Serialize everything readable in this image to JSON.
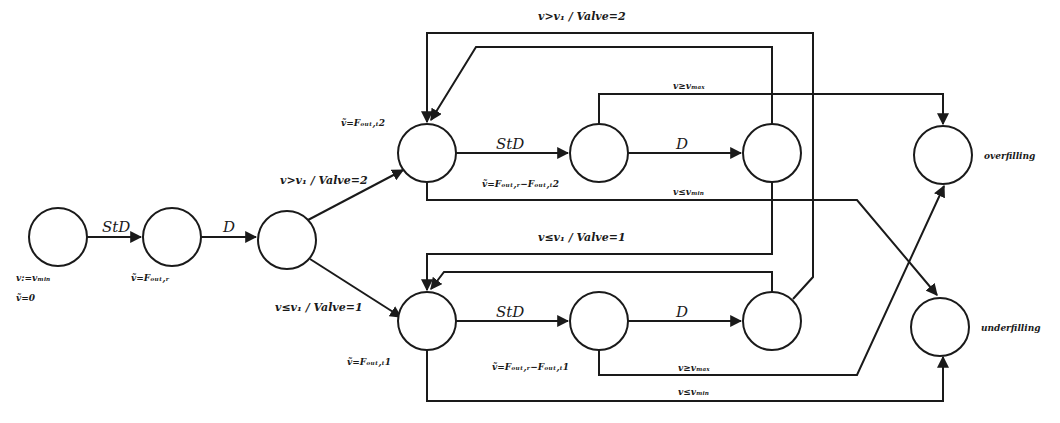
{
  "diagram": {
    "type": "state-machine",
    "states": {
      "init": {
        "label1": "v:=vₘᵢₙ",
        "label2": "ṽ=0"
      },
      "fill_r": {
        "label": "ṽ=Fₒᵤₜ,ᵣ"
      },
      "split": {
        "label": ""
      },
      "t2_a": {
        "label": "ṽ=Fₒᵤₜ,ₜ2"
      },
      "t2_b": {
        "label": "ṽ=Fₒᵤₜ,ᵣ−Fₒᵤₜ,ₜ2"
      },
      "t2_c": {
        "label": ""
      },
      "t1_a": {
        "label": "ṽ=Fₒᵤₜ,ₜ1"
      },
      "t1_b": {
        "label": "ṽ=Fₒᵤₜ,ᵣ−Fₒᵤₜ,ₜ1"
      },
      "t1_c": {
        "label": ""
      },
      "overfilling": {
        "label": "overfilling"
      },
      "underfilling": {
        "label": "underfilling"
      }
    },
    "transitions": {
      "init_to_r": "StD",
      "r_to_split": "D",
      "split_to_t2": "v>v₁ / Valve=2",
      "split_to_t1": "v≤v₁ / Valve=1",
      "t2_std": "StD",
      "t2_d": "D",
      "t1_std": "StD",
      "t1_d": "D",
      "loop_to_t2": "v>v₁ / Valve=2",
      "loop_to_t1": "v≤v₁ / Valve=1",
      "t2_vmax": "v≥vₘₐₓ",
      "t2_vmin": "v≤vₘᵢₙ",
      "t1_vmax": "v≥vₘₐₓ",
      "t1_vmin": "v≤vₘᵢₙ"
    }
  }
}
